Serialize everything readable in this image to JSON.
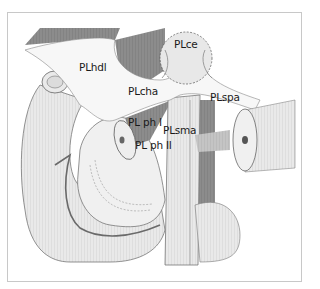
{
  "figure": {
    "type": "anatomical-illustration",
    "labels": [
      {
        "id": "PLce",
        "text": "PLce",
        "x": 174,
        "y": 44
      },
      {
        "id": "PLhdl",
        "text": "PLhdl",
        "x": 79,
        "y": 67
      },
      {
        "id": "PLcha",
        "text": "PLcha",
        "x": 128,
        "y": 91
      },
      {
        "id": "PLspa",
        "text": "PLspa",
        "x": 210,
        "y": 97
      },
      {
        "id": "PL_ph_I",
        "text": "PL ph I",
        "x": 128,
        "y": 122
      },
      {
        "id": "PLsma",
        "text": "PLsma",
        "x": 163,
        "y": 130
      },
      {
        "id": "PL_ph_II",
        "text": "PL ph  II",
        "x": 135,
        "y": 145
      }
    ]
  },
  "colors": {
    "frame": "#c8c8c8",
    "dark_tissue": "#8a8a8a",
    "mid_tissue": "#b5b5b5",
    "light_tissue": "#e6e6e6",
    "plexus": "#f2f2f2",
    "vessel_line": "#6a6a6a"
  }
}
